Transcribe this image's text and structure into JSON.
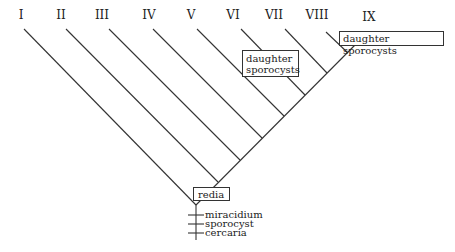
{
  "diagram": {
    "type": "cladogram",
    "branch_labels": [
      "I",
      "II",
      "III",
      "IV",
      "V",
      "VI",
      "VII",
      "VIII",
      "IX"
    ],
    "boxes": {
      "root": "redia",
      "mid_line1": "daughter",
      "mid_line2": "sporocysts",
      "top_right": "daughter sporocysts"
    },
    "trunk_stages": [
      "miracidium",
      "sporocyst",
      "cercaria"
    ],
    "line_color": "#333333"
  }
}
